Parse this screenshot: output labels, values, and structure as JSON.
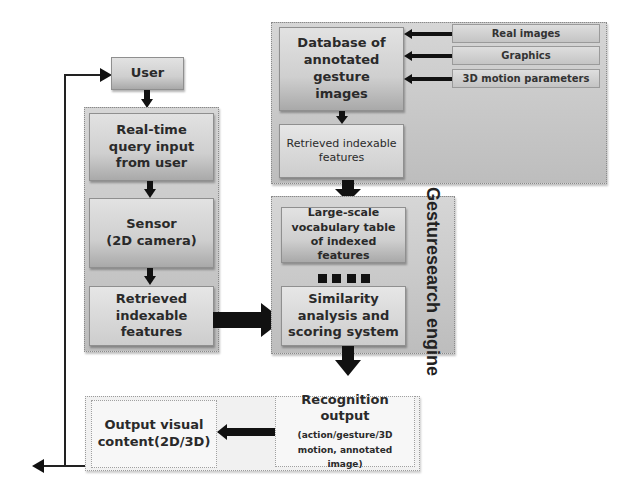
{
  "diagram": {
    "user": "User",
    "client": {
      "query": "Real-time query input from user",
      "sensor_line1": "Sensor",
      "sensor_line2": "(2D camera)",
      "retrieved": "Retrieved indexable features"
    },
    "database": {
      "title": "Database of annotated gesture images",
      "retrieved": "Retrieved indexable features",
      "sources": [
        "Real images",
        "Graphics",
        "3D motion parameters"
      ]
    },
    "engine": {
      "label_line1": "Gesture",
      "label_line2": "search engine",
      "vocab": "Large-scale vocabulary table of indexed features",
      "similarity": "Similarity analysis and scoring system"
    },
    "output": {
      "recognition_title": "Recognition output",
      "recognition_detail": "(action/gesture/3D motion, annotated image)",
      "visual": "Output visual content(2D/3D)"
    }
  },
  "colors": {
    "arrow": "#111111",
    "panel": "#c8c8c8",
    "box": "#d4d4d4"
  }
}
